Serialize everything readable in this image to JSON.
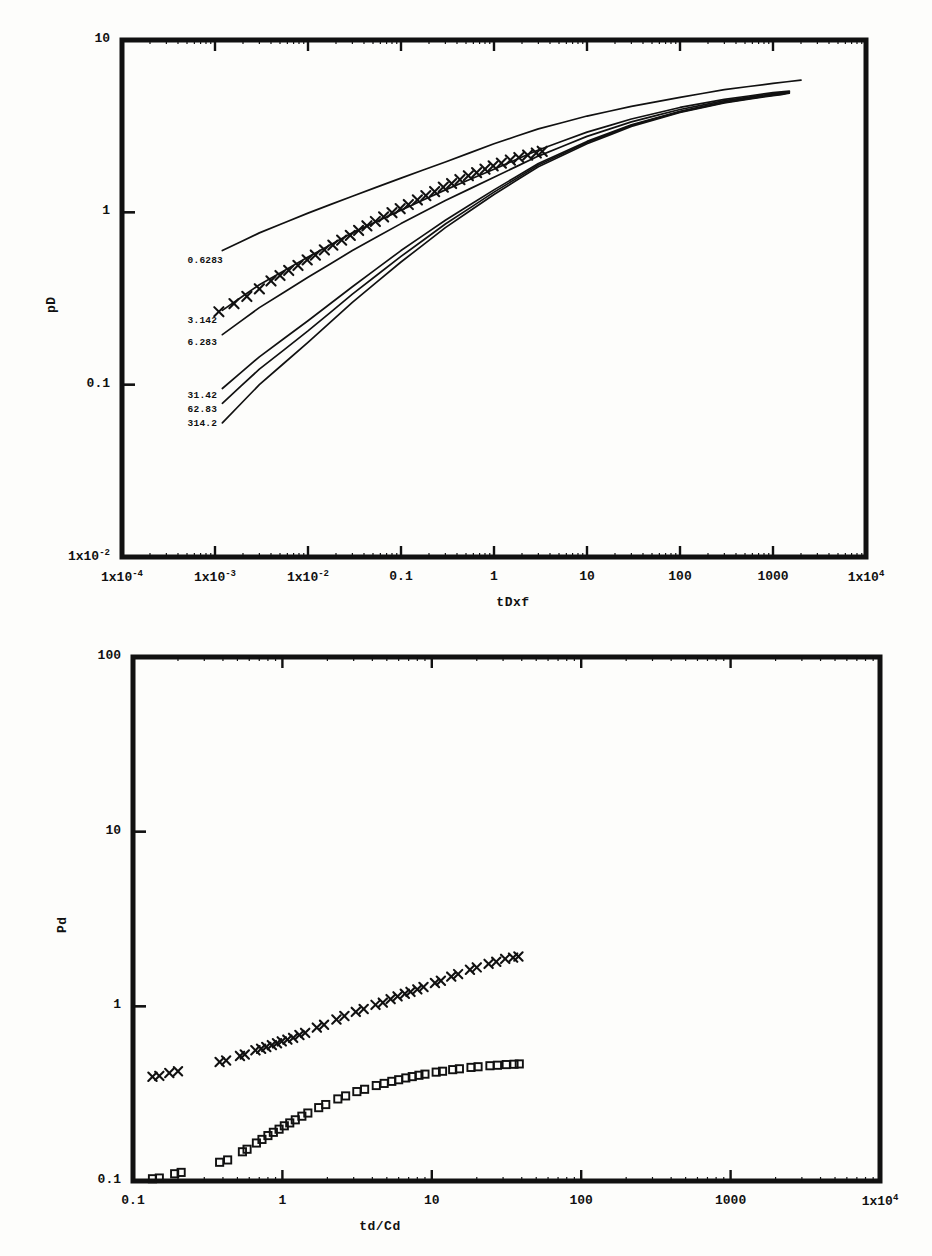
{
  "document": {
    "kind": "scientific-figure-page",
    "figure_count": 2
  },
  "chart_data": [
    {
      "id": "top",
      "type": "line",
      "title": "",
      "xlabel": "tDxf",
      "ylabel": "pD",
      "xscale": "log",
      "yscale": "log",
      "xlim": [
        0.0001,
        10000
      ],
      "ylim": [
        0.01,
        10
      ],
      "grid": false,
      "legend": "inline-curve-labels",
      "xticks": [
        {
          "value": 0.0001,
          "label": "1x10",
          "exp": "-4"
        },
        {
          "value": 0.001,
          "label": "1x10",
          "exp": "-3"
        },
        {
          "value": 0.01,
          "label": "1x10",
          "exp": "-2"
        },
        {
          "value": 0.1,
          "label": "0.1",
          "exp": ""
        },
        {
          "value": 1,
          "label": "1",
          "exp": ""
        },
        {
          "value": 10,
          "label": "10",
          "exp": ""
        },
        {
          "value": 100,
          "label": "100",
          "exp": ""
        },
        {
          "value": 1000,
          "label": "1000",
          "exp": ""
        },
        {
          "value": 10000,
          "label": "1x10",
          "exp": "4"
        }
      ],
      "yticks": [
        {
          "value": 10,
          "label": "10",
          "exp": ""
        },
        {
          "value": 1,
          "label": "1",
          "exp": ""
        },
        {
          "value": 0.1,
          "label": "0.1",
          "exp": ""
        },
        {
          "value": 0.01,
          "label": "1x10",
          "exp": "-2"
        }
      ],
      "series": [
        {
          "name": "0.6283",
          "label": "0.6283",
          "label_x": 0.0013,
          "label_y": 0.52,
          "marker": "none",
          "points": [
            [
              0.0012,
              0.6
            ],
            [
              0.003,
              0.76
            ],
            [
              0.01,
              0.99
            ],
            [
              0.03,
              1.24
            ],
            [
              0.1,
              1.58
            ],
            [
              0.3,
              1.96
            ],
            [
              1,
              2.5
            ],
            [
              3,
              3.05
            ],
            [
              10,
              3.62
            ],
            [
              30,
              4.12
            ],
            [
              100,
              4.65
            ],
            [
              300,
              5.15
            ],
            [
              1000,
              5.6
            ],
            [
              2000,
              5.85
            ]
          ]
        },
        {
          "name": "3.142",
          "label": "3.142",
          "label_x": 0.0013,
          "label_y": 0.235,
          "marker": "cross",
          "points": [
            [
              0.0012,
              0.27
            ],
            [
              0.003,
              0.38
            ],
            [
              0.01,
              0.55
            ],
            [
              0.03,
              0.76
            ],
            [
              0.1,
              1.03
            ],
            [
              0.3,
              1.35
            ],
            [
              1,
              1.78
            ],
            [
              3,
              2.3
            ],
            [
              10,
              2.92
            ],
            [
              30,
              3.48
            ],
            [
              100,
              4.06
            ],
            [
              300,
              4.52
            ],
            [
              1000,
              4.95
            ],
            [
              1500,
              5.05
            ]
          ]
        },
        {
          "name": "6.283",
          "label": "6.283",
          "label_x": 0.0013,
          "label_y": 0.175,
          "marker": "none",
          "points": [
            [
              0.0012,
              0.195
            ],
            [
              0.003,
              0.28
            ],
            [
              0.01,
              0.42
            ],
            [
              0.03,
              0.6
            ],
            [
              0.1,
              0.86
            ],
            [
              0.3,
              1.17
            ],
            [
              1,
              1.6
            ],
            [
              3,
              2.12
            ],
            [
              10,
              2.76
            ],
            [
              30,
              3.35
            ],
            [
              100,
              3.95
            ],
            [
              300,
              4.45
            ],
            [
              1000,
              4.88
            ],
            [
              1500,
              5.0
            ]
          ]
        },
        {
          "name": "31.42",
          "label": "31.42",
          "label_x": 0.0013,
          "label_y": 0.086,
          "marker": "none",
          "points": [
            [
              0.0012,
              0.095
            ],
            [
              0.003,
              0.145
            ],
            [
              0.01,
              0.235
            ],
            [
              0.03,
              0.37
            ],
            [
              0.1,
              0.6
            ],
            [
              0.3,
              0.9
            ],
            [
              1,
              1.35
            ],
            [
              3,
              1.92
            ],
            [
              10,
              2.58
            ],
            [
              30,
              3.22
            ],
            [
              100,
              3.86
            ],
            [
              300,
              4.38
            ],
            [
              1000,
              4.82
            ],
            [
              1500,
              4.95
            ]
          ]
        },
        {
          "name": "62.83",
          "label": "62.83",
          "label_x": 0.0013,
          "label_y": 0.0715,
          "marker": "none",
          "points": [
            [
              0.0012,
              0.078
            ],
            [
              0.003,
              0.123
            ],
            [
              0.01,
              0.205
            ],
            [
              0.03,
              0.335
            ],
            [
              0.1,
              0.555
            ],
            [
              0.3,
              0.855
            ],
            [
              1,
              1.31
            ],
            [
              3,
              1.88
            ],
            [
              10,
              2.54
            ],
            [
              30,
              3.19
            ],
            [
              100,
              3.83
            ],
            [
              300,
              4.35
            ],
            [
              1000,
              4.79
            ],
            [
              1500,
              4.92
            ]
          ]
        },
        {
          "name": "314.2",
          "label": "314.2",
          "label_x": 0.0013,
          "label_y": 0.059,
          "marker": "none",
          "points": [
            [
              0.0012,
              0.06
            ],
            [
              0.003,
              0.1
            ],
            [
              0.01,
              0.176
            ],
            [
              0.03,
              0.3
            ],
            [
              0.1,
              0.515
            ],
            [
              0.3,
              0.815
            ],
            [
              1,
              1.27
            ],
            [
              3,
              1.84
            ],
            [
              10,
              2.5
            ],
            [
              30,
              3.15
            ],
            [
              100,
              3.8
            ],
            [
              300,
              4.32
            ],
            [
              1000,
              4.76
            ],
            [
              1500,
              4.89
            ]
          ]
        }
      ],
      "overlay_markers": {
        "name": "match-points-top",
        "marker": "cross",
        "on_series": "3.142",
        "points": [
          [
            0.0011,
            0.265
          ],
          [
            0.0016,
            0.295
          ],
          [
            0.0022,
            0.325
          ],
          [
            0.003,
            0.36
          ],
          [
            0.004,
            0.4
          ],
          [
            0.005,
            0.43
          ],
          [
            0.0062,
            0.46
          ],
          [
            0.0078,
            0.492
          ],
          [
            0.0098,
            0.53
          ],
          [
            0.012,
            0.565
          ],
          [
            0.015,
            0.605
          ],
          [
            0.0185,
            0.645
          ],
          [
            0.023,
            0.69
          ],
          [
            0.0285,
            0.735
          ],
          [
            0.035,
            0.785
          ],
          [
            0.043,
            0.835
          ],
          [
            0.053,
            0.885
          ],
          [
            0.065,
            0.94
          ],
          [
            0.08,
            0.995
          ],
          [
            0.098,
            1.05
          ],
          [
            0.12,
            1.11
          ],
          [
            0.15,
            1.18
          ],
          [
            0.185,
            1.25
          ],
          [
            0.23,
            1.32
          ],
          [
            0.285,
            1.4
          ],
          [
            0.35,
            1.47
          ],
          [
            0.43,
            1.55
          ],
          [
            0.53,
            1.63
          ],
          [
            0.65,
            1.7
          ],
          [
            0.8,
            1.78
          ],
          [
            0.98,
            1.86
          ],
          [
            1.2,
            1.93
          ],
          [
            1.5,
            2.01
          ],
          [
            1.85,
            2.08
          ],
          [
            2.3,
            2.15
          ],
          [
            2.85,
            2.21
          ],
          [
            3.3,
            2.26
          ]
        ]
      }
    },
    {
      "id": "bottom",
      "type": "scatter",
      "title": "",
      "xlabel": "td/Cd",
      "ylabel": "Pd",
      "xscale": "log",
      "yscale": "log",
      "xlim": [
        0.1,
        10000
      ],
      "ylim": [
        0.1,
        100
      ],
      "grid": false,
      "legend": "none",
      "xticks": [
        {
          "value": 0.1,
          "label": "0.1",
          "exp": ""
        },
        {
          "value": 1,
          "label": "1",
          "exp": ""
        },
        {
          "value": 10,
          "label": "10",
          "exp": ""
        },
        {
          "value": 100,
          "label": "100",
          "exp": ""
        },
        {
          "value": 1000,
          "label": "1000",
          "exp": ""
        },
        {
          "value": 10000,
          "label": "1x10",
          "exp": "4"
        }
      ],
      "yticks": [
        {
          "value": 100,
          "label": "100",
          "exp": ""
        },
        {
          "value": 10,
          "label": "10",
          "exp": ""
        },
        {
          "value": 1,
          "label": "1",
          "exp": ""
        },
        {
          "value": 0.1,
          "label": "0.1",
          "exp": ""
        }
      ],
      "series": [
        {
          "name": "pressure-cross-series",
          "label": "",
          "marker": "cross",
          "points": [
            [
              0.135,
              0.395
            ],
            [
              0.15,
              0.4
            ],
            [
              0.175,
              0.415
            ],
            [
              0.2,
              0.425
            ],
            [
              0.38,
              0.48
            ],
            [
              0.42,
              0.49
            ],
            [
              0.52,
              0.52
            ],
            [
              0.56,
              0.53
            ],
            [
              0.66,
              0.56
            ],
            [
              0.72,
              0.572
            ],
            [
              0.78,
              0.585
            ],
            [
              0.85,
              0.6
            ],
            [
              0.92,
              0.615
            ],
            [
              0.99,
              0.63
            ],
            [
              1.08,
              0.645
            ],
            [
              1.18,
              0.66
            ],
            [
              1.3,
              0.685
            ],
            [
              1.42,
              0.705
            ],
            [
              1.7,
              0.755
            ],
            [
              1.9,
              0.785
            ],
            [
              2.3,
              0.84
            ],
            [
              2.6,
              0.88
            ],
            [
              3.1,
              0.93
            ],
            [
              3.5,
              0.965
            ],
            [
              4.2,
              1.02
            ],
            [
              4.7,
              1.05
            ],
            [
              5.3,
              1.1
            ],
            [
              5.9,
              1.14
            ],
            [
              6.6,
              1.18
            ],
            [
              7.2,
              1.21
            ],
            [
              8.0,
              1.25
            ],
            [
              8.8,
              1.29
            ],
            [
              10.5,
              1.36
            ],
            [
              11.5,
              1.4
            ],
            [
              13.5,
              1.48
            ],
            [
              15.0,
              1.53
            ],
            [
              18.0,
              1.62
            ],
            [
              20.0,
              1.67
            ],
            [
              24.0,
              1.75
            ],
            [
              27.0,
              1.8
            ],
            [
              31.0,
              1.87
            ],
            [
              35.0,
              1.9
            ],
            [
              38.0,
              1.93
            ]
          ]
        },
        {
          "name": "pressure-square-series",
          "label": "",
          "marker": "square",
          "points": [
            [
              0.135,
              0.103
            ],
            [
              0.15,
              0.104
            ],
            [
              0.19,
              0.11
            ],
            [
              0.21,
              0.112
            ],
            [
              0.38,
              0.128
            ],
            [
              0.43,
              0.132
            ],
            [
              0.54,
              0.147
            ],
            [
              0.58,
              0.152
            ],
            [
              0.67,
              0.165
            ],
            [
              0.73,
              0.173
            ],
            [
              0.8,
              0.182
            ],
            [
              0.87,
              0.19
            ],
            [
              0.95,
              0.198
            ],
            [
              1.03,
              0.207
            ],
            [
              1.12,
              0.215
            ],
            [
              1.22,
              0.224
            ],
            [
              1.35,
              0.235
            ],
            [
              1.48,
              0.245
            ],
            [
              1.75,
              0.263
            ],
            [
              1.95,
              0.274
            ],
            [
              2.35,
              0.295
            ],
            [
              2.65,
              0.307
            ],
            [
              3.15,
              0.325
            ],
            [
              3.55,
              0.335
            ],
            [
              4.25,
              0.352
            ],
            [
              4.8,
              0.362
            ],
            [
              5.4,
              0.372
            ],
            [
              6.0,
              0.38
            ],
            [
              6.7,
              0.389
            ],
            [
              7.4,
              0.396
            ],
            [
              8.2,
              0.403
            ],
            [
              9.0,
              0.409
            ],
            [
              10.7,
              0.42
            ],
            [
              11.8,
              0.425
            ],
            [
              13.8,
              0.434
            ],
            [
              15.3,
              0.439
            ],
            [
              18.3,
              0.447
            ],
            [
              20.4,
              0.451
            ],
            [
              24.5,
              0.457
            ],
            [
              27.5,
              0.46
            ],
            [
              31.5,
              0.464
            ],
            [
              35.5,
              0.466
            ],
            [
              38.5,
              0.468
            ]
          ]
        }
      ]
    }
  ],
  "style": {
    "ink": "#111111",
    "paper": "#fdfdfb",
    "frame_width": 5
  }
}
